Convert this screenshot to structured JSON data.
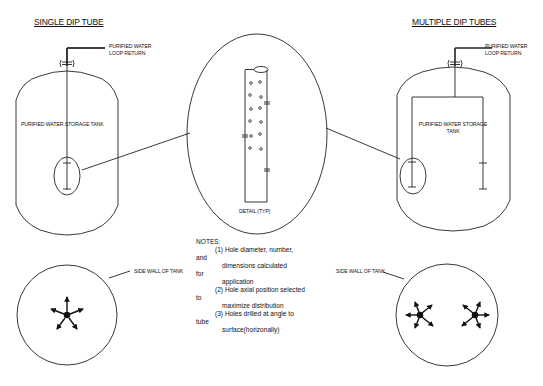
{
  "titles": {
    "single": "SINGLE DIP TUBE",
    "multiple": "MULTIPLE DIP TUBES"
  },
  "labels": {
    "loop_return_left_1": "PURIFIED WATER",
    "loop_return_left_2": "LOOP RETURN",
    "loop_return_right_1": "PURIFIED WATER",
    "loop_return_right_2": "LOOP RETURN",
    "tank_left": "PURIFIED WATER STORAGE TANK",
    "tank_right_1": "PURIFIED WATER STORAGE",
    "tank_right_2": "TANK",
    "detail": "DETAIL (TYP)",
    "side_wall_left": "SIDE WALL OF TANK",
    "side_wall_right": "SIDE WALL OF TANK"
  },
  "notes": {
    "heading": "NOTES:",
    "lines": [
      "(1) Hole diameter, number,",
      "and",
      "dimensions calculated",
      "for",
      "application",
      "(2) Hole axial position selected",
      "to",
      "maximize distribution",
      "(3) Holes drilled at angle to",
      "tube",
      "surface(horizonally)"
    ]
  },
  "colors": {
    "stroke": "#222222",
    "background": "#ffffff"
  }
}
